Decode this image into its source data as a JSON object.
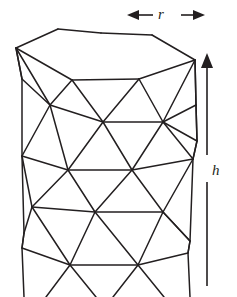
{
  "figure": {
    "type": "geometric-diagram",
    "width": 237,
    "height": 297,
    "background_color": "#ffffff",
    "line_color": "#231f20",
    "line_width": 1.5
  },
  "labels": {
    "radius": "r",
    "height": "h"
  },
  "annotations": {
    "radius_arrow": {
      "name": "double-headed-horizontal-arrow",
      "x_start": 127,
      "x_end": 205,
      "y": 15,
      "heads": "both"
    },
    "height_arrow": {
      "name": "single-headed-vertical-arrow",
      "x": 207,
      "y_top": 53,
      "y_bottom": 286,
      "heads": "top"
    }
  },
  "mesh": {
    "description": "Triangulated cylindrical surface drawn in wireframe, hexagonal top cap, four bands of alternating triangles, cut off at image bottom",
    "top_cap_polygon": [
      [
        16,
        48
      ],
      [
        58,
        29
      ],
      [
        100,
        33
      ],
      [
        152,
        35
      ],
      [
        195,
        60
      ],
      [
        139,
        79
      ],
      [
        72,
        80
      ]
    ],
    "rings": [
      {
        "name": "ring-top-rim",
        "vertices": [
          [
            16,
            48
          ],
          [
            58,
            29
          ],
          [
            100,
            33
          ],
          [
            152,
            35
          ],
          [
            195,
            60
          ],
          [
            139,
            79
          ],
          [
            72,
            80
          ]
        ]
      },
      {
        "name": "ring-1",
        "vertices": [
          [
            50,
            105
          ],
          [
            103,
            122
          ],
          [
            163,
            122
          ],
          [
            196,
            104
          ],
          [
            22,
            78
          ]
        ]
      },
      {
        "name": "ring-2",
        "vertices": [
          [
            22,
            155
          ],
          [
            68,
            170
          ],
          [
            132,
            170
          ],
          [
            193,
            158
          ],
          [
            197,
            140
          ]
        ]
      },
      {
        "name": "ring-3",
        "vertices": [
          [
            32,
            207
          ],
          [
            95,
            212
          ],
          [
            163,
            212
          ],
          [
            190,
            240
          ],
          [
            24,
            232
          ]
        ]
      },
      {
        "name": "ring-4",
        "vertices": [
          [
            70,
            265
          ],
          [
            138,
            265
          ],
          [
            22,
            247
          ],
          [
            188,
            252
          ]
        ]
      }
    ],
    "silhouette": {
      "left_edge": [
        [
          16,
          48
        ],
        [
          22,
          78
        ],
        [
          22,
          155
        ],
        [
          24,
          232
        ],
        [
          22,
          247
        ],
        [
          24,
          297
        ]
      ],
      "right_edge": [
        [
          195,
          60
        ],
        [
          196,
          104
        ],
        [
          197,
          140
        ],
        [
          193,
          158
        ],
        [
          190,
          240
        ],
        [
          188,
          252
        ],
        [
          190,
          297
        ]
      ]
    }
  }
}
